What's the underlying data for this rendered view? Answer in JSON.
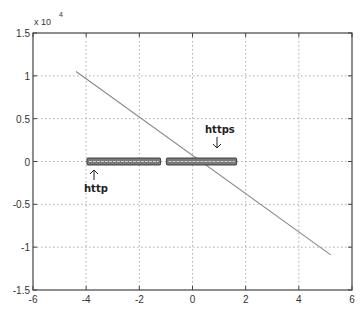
{
  "chart_data": {
    "type": "line",
    "title": "",
    "xlabel": "",
    "ylabel": "",
    "y_multiplier": "x 10^4",
    "xlim": [
      -6,
      6
    ],
    "ylim": [
      -1.5,
      1.5
    ],
    "grid": true,
    "x_ticks": [
      -6,
      -4,
      -2,
      0,
      2,
      4,
      6
    ],
    "x_tick_labels": [
      "-6",
      "-4",
      "-2",
      "0",
      "2",
      "4",
      "6"
    ],
    "y_ticks": [
      -1.5,
      -1,
      -0.5,
      0,
      0.5,
      1,
      1.5
    ],
    "y_tick_labels": [
      "-1.5",
      "-1",
      "-0.5",
      "0",
      "0.5",
      "1",
      "1.5"
    ],
    "series": [
      {
        "name": "regression line",
        "kind": "line",
        "color": "#888888",
        "x": [
          -4.38,
          5.2
        ],
        "y": [
          1.05,
          -1.09
        ]
      },
      {
        "name": "http",
        "kind": "cluster-bar",
        "color": "#555555",
        "x_range": [
          -3.97,
          -1.2
        ],
        "y_center": 0,
        "y_half_height": 0.02
      },
      {
        "name": "https",
        "kind": "cluster-bar",
        "color": "#555555",
        "x_range": [
          -0.98,
          1.66
        ],
        "y_center": 0,
        "y_half_height": 0.02
      }
    ],
    "annotations": [
      {
        "text": "http",
        "arrow": "up",
        "x": -3.7,
        "y": -0.22
      },
      {
        "text": "https",
        "arrow": "down",
        "x": 1.0,
        "y": 0.22
      }
    ]
  },
  "labels": {
    "multiplier_base": "x 10",
    "multiplier_exp": "4",
    "http": "http",
    "https": "https"
  }
}
